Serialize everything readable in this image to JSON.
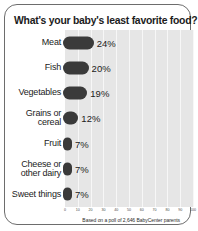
{
  "chart_data": {
    "type": "bar",
    "orientation": "horizontal",
    "title": "What's your baby's least favorite food?",
    "categories": [
      "Meat",
      "Fish",
      "Vegetables",
      "Grains or cereal",
      "Fruit",
      "Cheese or other dairy",
      "Sweet things"
    ],
    "values": [
      24,
      20,
      19,
      12,
      7,
      7,
      7
    ],
    "value_labels": [
      "24%",
      "20%",
      "19%",
      "12%",
      "7%",
      "7%",
      "7%"
    ],
    "xlabel": "",
    "ylabel": "",
    "xlim": [
      0,
      100
    ],
    "ticks": [
      "0",
      "10",
      "20",
      "30",
      "40",
      "50",
      "60",
      "70",
      "80",
      "90",
      "100"
    ],
    "grid": true,
    "legend": false,
    "source_note": "Based on a poll of 2,646 BabyCenter parents",
    "colors": {
      "bar": "#3a3a3a",
      "plot_background": "#e6e6e6",
      "gridline": "#f7f7f7",
      "card_border": "#6d6d6d",
      "text": "#1b1b1b"
    }
  }
}
